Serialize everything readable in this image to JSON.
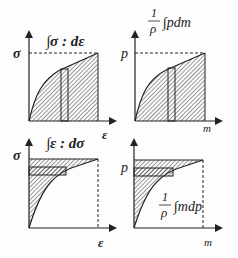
{
  "panels": [
    {
      "id": "top-left",
      "integral": "∫σ : dε",
      "y_label": "σ",
      "x_label": "ε"
    },
    {
      "id": "top-right",
      "integral_prefix_num": "1",
      "integral_prefix_den": "ρ",
      "integral": "∫pdm",
      "y_label": "p",
      "x_label": "m"
    },
    {
      "id": "bottom-left",
      "integral": "∫ε : dσ",
      "y_label": "σ",
      "x_label": "ε"
    },
    {
      "id": "bottom-right",
      "integral_prefix_num": "1",
      "integral_prefix_den": "ρ",
      "integral": "∫mdp",
      "y_label": "p",
      "x_label": "m"
    }
  ],
  "colors": {
    "ink": "#222222",
    "background": "#fdfdfd"
  }
}
